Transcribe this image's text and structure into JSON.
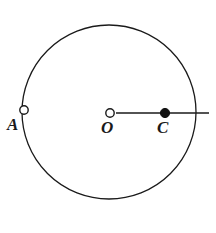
{
  "figure": {
    "kind": "geometry-diagram",
    "background_color": "#ffffff",
    "stroke_color": "#1a1a1a",
    "width": 216,
    "height": 233
  },
  "circle": {
    "name": "main-circle",
    "center_x": 109,
    "center_y": 112,
    "radius": 87,
    "stroke_width": 1.3,
    "fill": "none"
  },
  "ray": {
    "name": "horizontal-ray",
    "from_x": 116,
    "to_x": 209,
    "y": 113,
    "stroke_width": 1.6,
    "description": "horizontal segment from center O through C extending beyond the circle"
  },
  "points": [
    {
      "id": "A",
      "label": "A",
      "marker": "open-circle",
      "x": 24,
      "y": 110,
      "radius": 4.2,
      "fill": "#ffffff",
      "stroke": "#1a1a1a",
      "label_x": 7,
      "label_y": 116,
      "on_circle": true
    },
    {
      "id": "O",
      "label": "O",
      "marker": "open-circle",
      "x": 110,
      "y": 113,
      "radius": 4.2,
      "fill": "#ffffff",
      "stroke": "#1a1a1a",
      "label_x": 101,
      "label_y": 119,
      "on_circle": false
    },
    {
      "id": "C",
      "label": "C",
      "marker": "filled-circle",
      "x": 165,
      "y": 113,
      "radius": 4.6,
      "fill": "#111111",
      "stroke": "#111111",
      "label_x": 157,
      "label_y": 119,
      "on_circle": false
    }
  ]
}
